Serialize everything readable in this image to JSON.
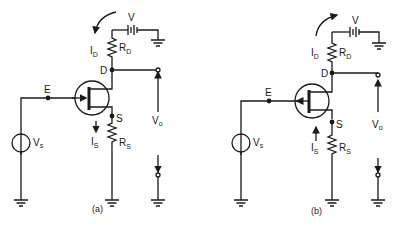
{
  "figure": {
    "caption_faint": "",
    "circuits": [
      {
        "id": "a",
        "caption": "(a)",
        "labels": {
          "battery": "V",
          "drain_current": "I",
          "drain_current_sub": "D",
          "drain_resistor": "R",
          "drain_resistor_sub": "D",
          "drain_node": "D",
          "input_node": "E",
          "source_node": "S",
          "source_current": "I",
          "source_current_sub": "S",
          "source_resistor": "R",
          "source_resistor_sub": "S",
          "signal_source": "V",
          "signal_source_sub": "s",
          "output": "V",
          "output_sub": "o"
        },
        "current_arrow_direction": "counterclockwise-down",
        "source_current_direction": "down"
      },
      {
        "id": "b",
        "caption": "(b)",
        "labels": {
          "battery": "V",
          "drain_current": "I",
          "drain_current_sub": "D",
          "drain_resistor": "R",
          "drain_resistor_sub": "D",
          "drain_node": "D",
          "input_node": "E",
          "source_node": "S",
          "source_current": "I",
          "source_current_sub": "S",
          "source_resistor": "R",
          "source_resistor_sub": "S",
          "signal_source": "V",
          "signal_source_sub": "s",
          "output": "V",
          "output_sub": "o"
        },
        "current_arrow_direction": "clockwise-up",
        "source_current_direction": "up"
      }
    ]
  }
}
